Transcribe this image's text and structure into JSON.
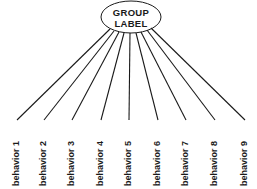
{
  "group": {
    "line1": "GROUP",
    "line2": "LABEL"
  },
  "behaviors": [
    {
      "label": "behavior 1",
      "x": 17
    },
    {
      "label": "behavior 2",
      "x": 44
    },
    {
      "label": "behavior 3",
      "x": 72
    },
    {
      "label": "behavior 4",
      "x": 101
    },
    {
      "label": "behavior 5",
      "x": 129
    },
    {
      "label": "behavior 6",
      "x": 158
    },
    {
      "label": "behavior 7",
      "x": 186
    },
    {
      "label": "behavior 8",
      "x": 215
    },
    {
      "label": "behavior 9",
      "x": 245
    }
  ],
  "colors": {
    "stroke": "#1a1a1a",
    "background": "#ffffff"
  }
}
